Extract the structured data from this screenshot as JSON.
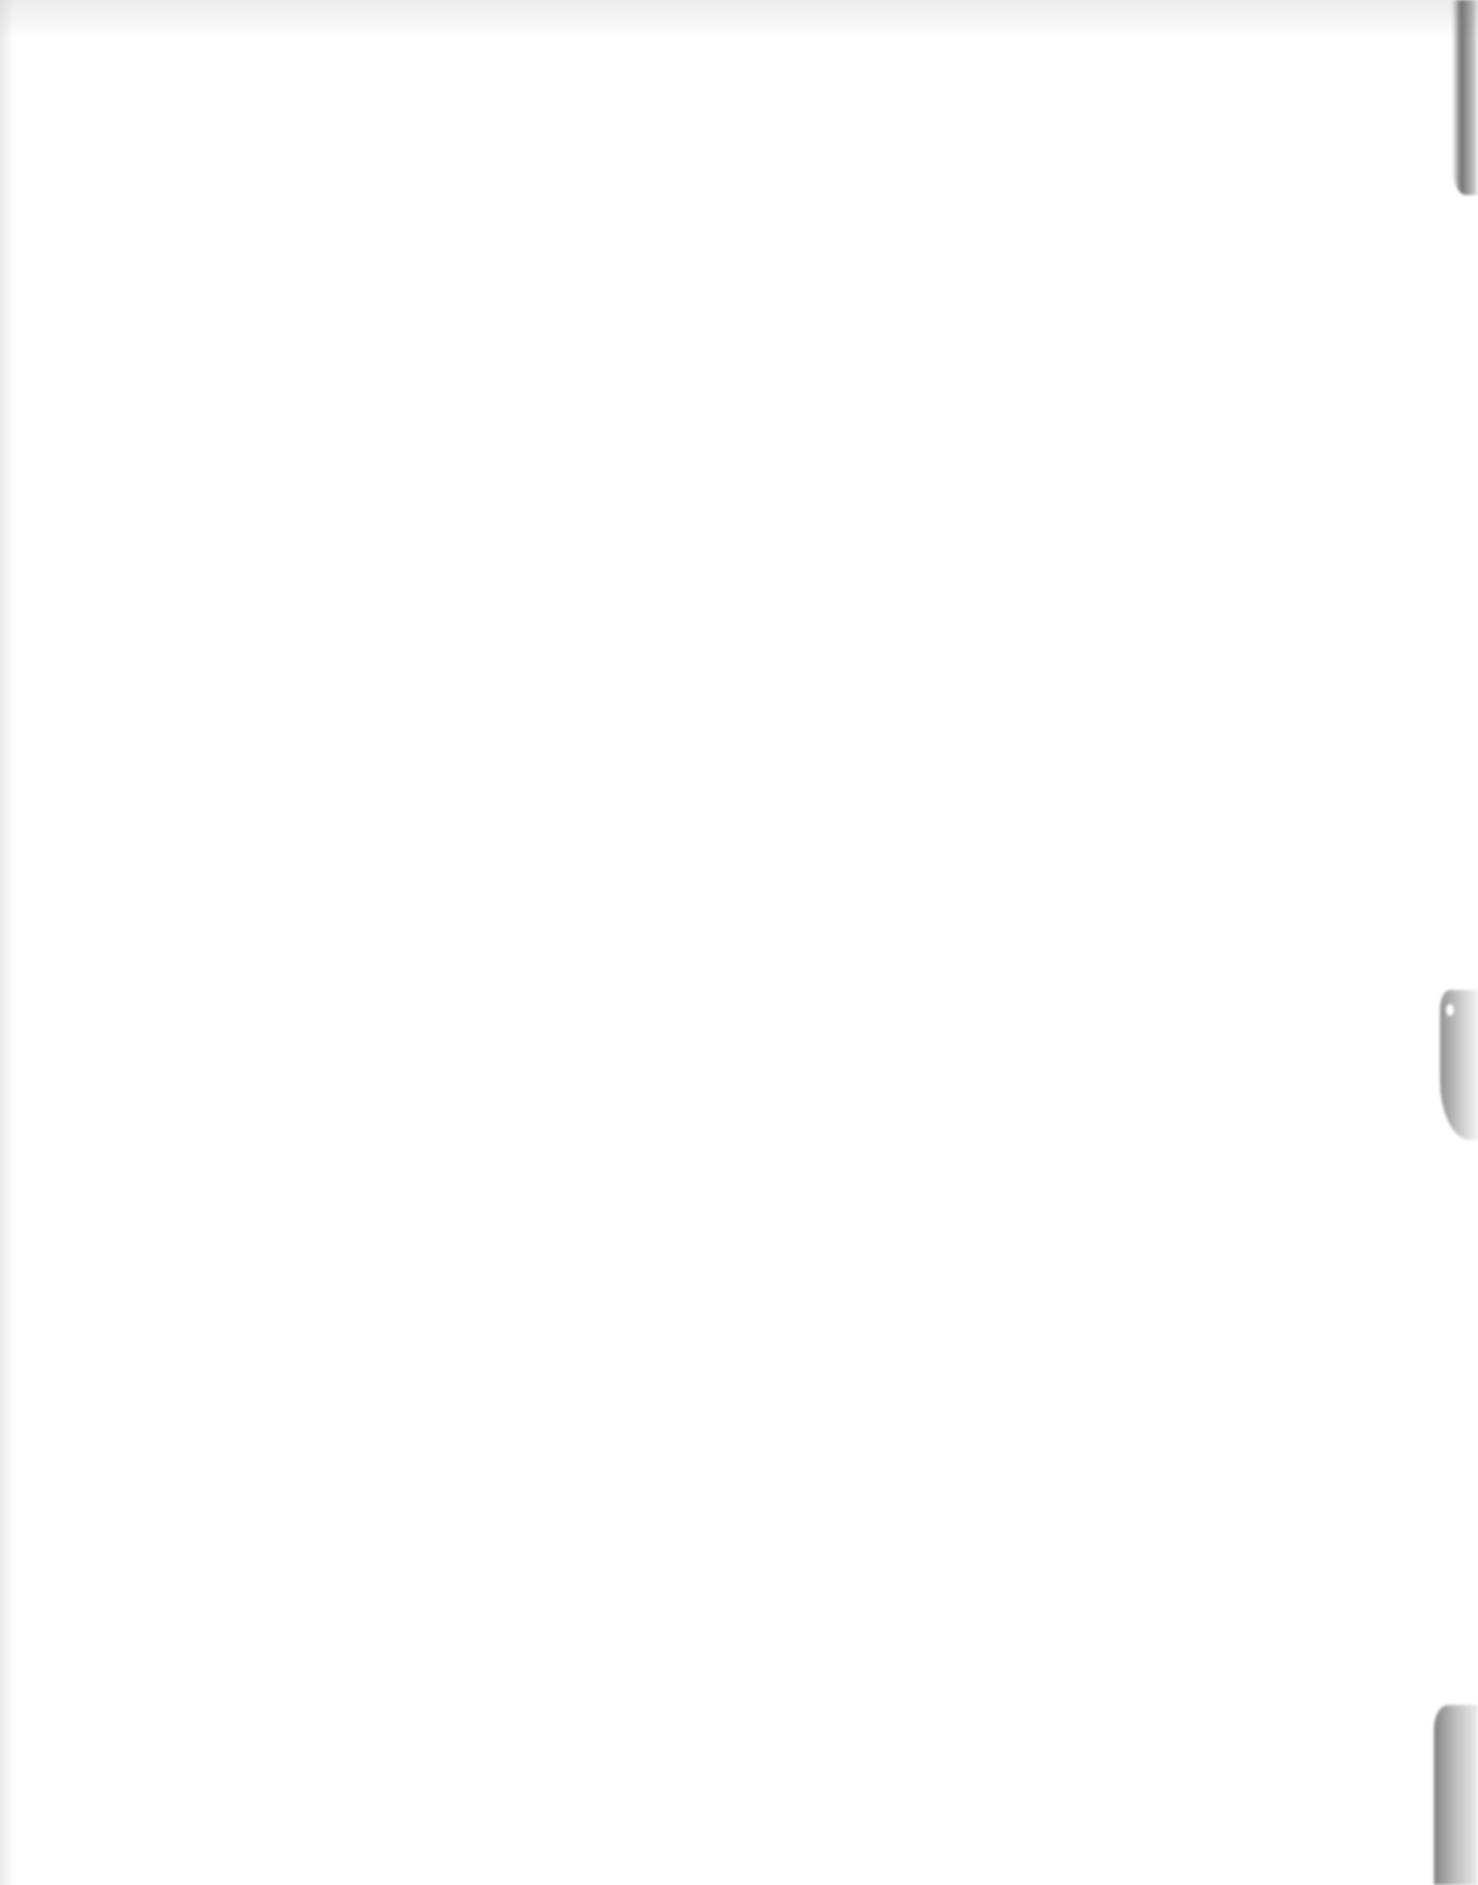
{
  "document": {
    "type": "blank-scanned-page",
    "text_content": "",
    "background_color": "#ffffff",
    "artifacts": [
      {
        "name": "right-edge-shadow-top",
        "color": "#5a5a5a"
      },
      {
        "name": "right-edge-shadow-middle",
        "color": "#707070"
      },
      {
        "name": "right-edge-shadow-bottom",
        "color": "#646464"
      }
    ]
  }
}
